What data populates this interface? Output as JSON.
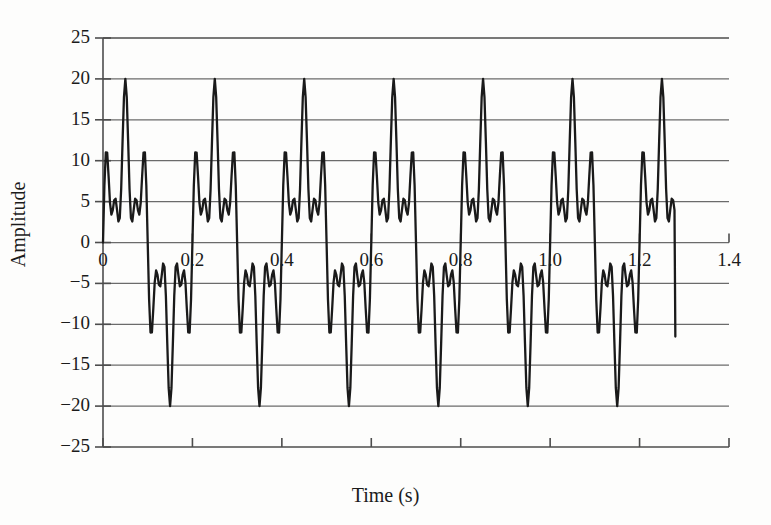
{
  "chart_data": {
    "type": "line",
    "title": "",
    "subtitle": "",
    "xlabel": "Time (s)",
    "ylabel": "Amplitude",
    "xlim": [
      0,
      1.4
    ],
    "ylim": [
      -25,
      25
    ],
    "xticks": [
      "0",
      "0.2",
      "0.4",
      "0.6",
      "0.8",
      "1.0",
      "1.2",
      "1.4"
    ],
    "xtick_values": [
      0,
      0.2,
      0.4,
      0.6,
      0.8,
      1.0,
      1.2,
      1.4
    ],
    "yticks": [
      "25",
      "20",
      "15",
      "10",
      "5",
      "0",
      "−5",
      "−10",
      "−15",
      "−20",
      "−25"
    ],
    "ytick_values": [
      25,
      20,
      15,
      10,
      5,
      0,
      -5,
      -10,
      -15,
      -20,
      -25
    ],
    "grid": "horizontal",
    "legend": "none",
    "line_color": "#1a1a1a",
    "line_width": 2.3,
    "grid_color": "#6b6b6b",
    "axis_color": "#4d4d4d",
    "background": "#fdfdfc",
    "series": [
      {
        "name": "signal",
        "description": "Periodic multi-frequency waveform, period 0.2 s, amplitude envelope ±20",
        "data_end_x": 1.28,
        "data_end_y": -11.5,
        "period": 0.2,
        "peak_amplitude": 20,
        "trough_amplitude": -20,
        "components": [
          {
            "amplitude": 10,
            "frequency_hz": 5,
            "phase": 0
          },
          {
            "amplitude": 6.5,
            "frequency_hz": 25,
            "phase": 0
          },
          {
            "amplitude": 4.0,
            "frequency_hz": 45,
            "phase": 0
          }
        ],
        "samples_per_period": 64
      }
    ]
  },
  "axes": {
    "xlabel": "Time (s)",
    "ylabel": "Amplitude"
  }
}
